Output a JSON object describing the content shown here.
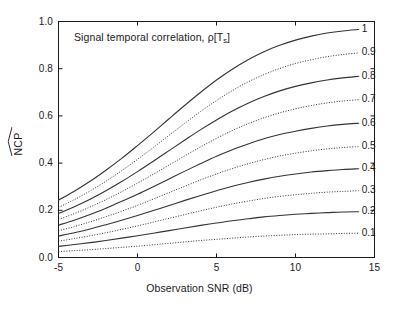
{
  "figure": {
    "background": "#ffffff",
    "foreground": "#1a1a1a"
  },
  "annotation": {
    "prefix": "Signal temporal correlation, ",
    "symbol": "ρ[T",
    "subscript": "s",
    "suffix": "]",
    "full": "Signal temporal correlation, ρ[Ts]"
  },
  "axes": {
    "y_title_text": "NCP",
    "y_title_accent": "hat",
    "x_title": "Observation SNR (dB)",
    "x_ticks": [
      "-5",
      "0",
      "5",
      "10",
      "15"
    ],
    "x_tick_values": [
      -5,
      0,
      5,
      10,
      15
    ],
    "y_ticks": [
      "0.0",
      "0.2",
      "0.4",
      "0.6",
      "0.8",
      "1.0"
    ],
    "y_tick_values": [
      0.0,
      0.2,
      0.4,
      0.6,
      0.8,
      1.0
    ],
    "xlim": [
      -5,
      15
    ],
    "ylim": [
      0.0,
      1.0
    ],
    "grid": false,
    "box": true,
    "tick_direction": "in"
  },
  "chart_data": {
    "type": "line",
    "title": "",
    "annotation": "Signal temporal correlation, ρ[Ts]",
    "xlabel": "Observation SNR (dB)",
    "ylabel": "NCP (estimated)",
    "xlim": [
      -5,
      15
    ],
    "ylim": [
      0.0,
      1.0
    ],
    "grid": false,
    "legend_position": "right-inside-curve-labels",
    "x": [
      -5,
      -4,
      -3,
      -2,
      -1,
      0,
      1,
      2,
      3,
      4,
      5,
      6,
      7,
      8,
      9,
      10,
      11,
      12,
      13,
      14
    ],
    "series": [
      {
        "name": "1",
        "label": "1",
        "style": "solid",
        "color": "#333333",
        "values": [
          0.243,
          0.281,
          0.323,
          0.37,
          0.42,
          0.474,
          0.53,
          0.588,
          0.645,
          0.7,
          0.752,
          0.798,
          0.838,
          0.872,
          0.899,
          0.921,
          0.938,
          0.951,
          0.96,
          0.966
        ]
      },
      {
        "name": "0.9",
        "label": "0.9",
        "style": "dotted",
        "color": "#333333",
        "values": [
          0.212,
          0.245,
          0.282,
          0.323,
          0.368,
          0.416,
          0.466,
          0.518,
          0.569,
          0.619,
          0.665,
          0.707,
          0.744,
          0.775,
          0.801,
          0.822,
          0.838,
          0.851,
          0.86,
          0.867
        ]
      },
      {
        "name": "0.8",
        "label": "0.8",
        "style": "solid",
        "color": "#333333",
        "values": [
          0.186,
          0.215,
          0.247,
          0.283,
          0.322,
          0.364,
          0.408,
          0.453,
          0.498,
          0.542,
          0.583,
          0.621,
          0.654,
          0.682,
          0.706,
          0.725,
          0.74,
          0.752,
          0.761,
          0.768
        ]
      },
      {
        "name": "0.7",
        "label": "0.7",
        "style": "dotted",
        "color": "#333333",
        "values": [
          0.161,
          0.186,
          0.214,
          0.245,
          0.279,
          0.315,
          0.353,
          0.392,
          0.431,
          0.469,
          0.505,
          0.538,
          0.567,
          0.592,
          0.613,
          0.63,
          0.644,
          0.655,
          0.663,
          0.669
        ]
      },
      {
        "name": "0.6",
        "label": "0.6",
        "style": "solid",
        "color": "#333333",
        "values": [
          0.137,
          0.158,
          0.182,
          0.209,
          0.238,
          0.268,
          0.3,
          0.333,
          0.366,
          0.398,
          0.429,
          0.457,
          0.481,
          0.503,
          0.521,
          0.535,
          0.547,
          0.557,
          0.564,
          0.569
        ]
      },
      {
        "name": "0.5",
        "label": "0.5",
        "style": "dotted",
        "color": "#333333",
        "values": [
          0.113,
          0.131,
          0.151,
          0.173,
          0.196,
          0.221,
          0.248,
          0.275,
          0.302,
          0.329,
          0.354,
          0.377,
          0.397,
          0.415,
          0.43,
          0.442,
          0.452,
          0.46,
          0.466,
          0.47
        ]
      },
      {
        "name": "0.4",
        "label": "0.4",
        "style": "solid",
        "color": "#333333",
        "values": [
          0.091,
          0.105,
          0.121,
          0.139,
          0.158,
          0.178,
          0.199,
          0.22,
          0.242,
          0.263,
          0.283,
          0.302,
          0.318,
          0.332,
          0.344,
          0.354,
          0.362,
          0.368,
          0.373,
          0.376
        ]
      },
      {
        "name": "0.3",
        "label": "0.3",
        "style": "dotted",
        "color": "#333333",
        "values": [
          0.069,
          0.08,
          0.092,
          0.105,
          0.119,
          0.134,
          0.15,
          0.166,
          0.182,
          0.198,
          0.213,
          0.227,
          0.239,
          0.25,
          0.259,
          0.266,
          0.272,
          0.277,
          0.28,
          0.283
        ]
      },
      {
        "name": "0.2",
        "label": "0.2",
        "style": "solid",
        "color": "#333333",
        "values": [
          0.047,
          0.055,
          0.063,
          0.072,
          0.082,
          0.092,
          0.103,
          0.114,
          0.125,
          0.136,
          0.146,
          0.156,
          0.164,
          0.172,
          0.178,
          0.183,
          0.187,
          0.19,
          0.193,
          0.194
        ]
      },
      {
        "name": "0.1",
        "label": "0.1",
        "style": "dotted",
        "color": "#333333",
        "values": [
          0.025,
          0.029,
          0.033,
          0.038,
          0.043,
          0.048,
          0.054,
          0.06,
          0.066,
          0.072,
          0.077,
          0.082,
          0.087,
          0.091,
          0.094,
          0.097,
          0.099,
          0.1,
          0.102,
          0.103
        ]
      }
    ]
  }
}
